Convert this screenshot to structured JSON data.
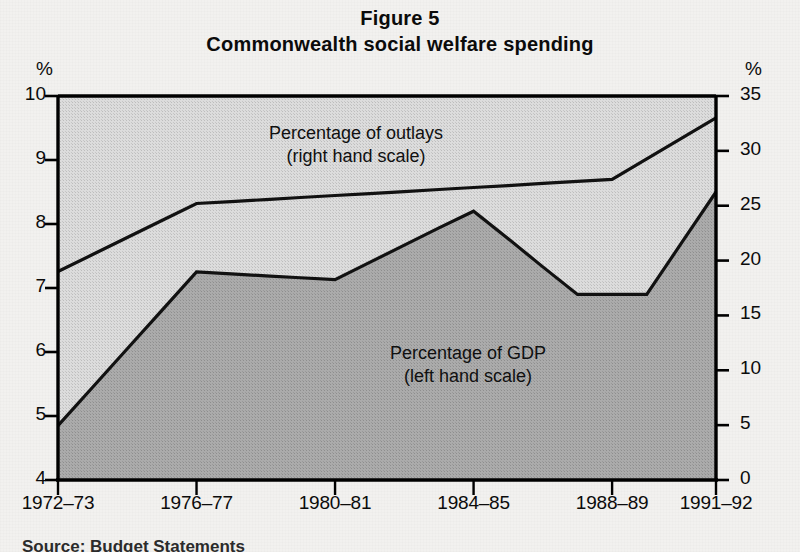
{
  "figure": {
    "title_line1": "Figure 5",
    "title_line2": "Commonwealth social welfare spending",
    "unit_left": "%",
    "unit_right": "%",
    "caption_partial": "Source: Budget Statements"
  },
  "colors": {
    "line": "#111111",
    "axis": "#000000",
    "band_upper": "#d8d8d8",
    "band_lower": "#a9a9a9",
    "text": "#0b0b0b",
    "page_background": "#f2f1ef"
  },
  "annotations": {
    "outlays_label_line1": "Percentage of outlays",
    "outlays_label_line2": "(right hand scale)",
    "gdp_label_line1": "Percentage of GDP",
    "gdp_label_line2": "(left hand scale)"
  },
  "chart_data": {
    "type": "area",
    "title": "Commonwealth social welfare spending",
    "subtitle": "Figure 5",
    "xlabel": "",
    "ylabel": "%",
    "y2label": "%",
    "grid": false,
    "legend_position": "inside-plot-annotations",
    "x": [
      "1972-73",
      "1973-74",
      "1974-75",
      "1975-76",
      "1976-77",
      "1977-78",
      "1978-79",
      "1979-80",
      "1980-81",
      "1981-82",
      "1982-83",
      "1983-84",
      "1984-85",
      "1985-86",
      "1986-87",
      "1987-88",
      "1988-89",
      "1989-90",
      "1990-91",
      "1991-92"
    ],
    "x_tick_labels": [
      "1972–73",
      "1976–77",
      "1980–81",
      "1984–85",
      "1988–89",
      "1991–92"
    ],
    "x_tick_positions": [
      0,
      4,
      8,
      12,
      16,
      19
    ],
    "ylim": [
      4,
      10
    ],
    "y_ticks": [
      4,
      5,
      6,
      7,
      8,
      9,
      10
    ],
    "y2lim": [
      0,
      35
    ],
    "y2_ticks": [
      0,
      5,
      10,
      15,
      20,
      25,
      30,
      35
    ],
    "series": [
      {
        "name": "Percentage of outlays",
        "axis": "right",
        "units": "%",
        "vertices_x": [
          "1972-73",
          "1976-77",
          "1988-89",
          "1991-92"
        ],
        "vertices_y": [
          19.0,
          25.2,
          27.4,
          33.0
        ],
        "values": [
          19.0,
          20.55,
          22.1,
          23.65,
          25.2,
          25.38,
          25.56,
          25.75,
          25.93,
          26.11,
          26.29,
          26.48,
          26.66,
          26.84,
          27.03,
          27.21,
          27.4,
          29.27,
          31.13,
          33.0
        ]
      },
      {
        "name": "Percentage of GDP",
        "axis": "left",
        "units": "%",
        "vertices_x": [
          "1972-73",
          "1976-77",
          "1980-81",
          "1984-85",
          "1989-90",
          "1991-92"
        ],
        "vertices_y": [
          4.85,
          7.25,
          7.13,
          8.2,
          6.9,
          8.5
        ],
        "values": [
          4.85,
          5.45,
          6.05,
          6.65,
          7.25,
          7.22,
          7.19,
          7.16,
          7.13,
          7.4,
          7.67,
          7.94,
          8.2,
          7.77,
          7.33,
          6.9,
          6.9,
          6.9,
          7.7,
          8.5
        ]
      }
    ]
  }
}
